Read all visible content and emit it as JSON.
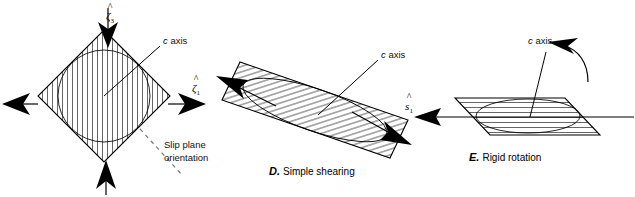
{
  "figure": {
    "background_color": "#ffffff",
    "line_color": "#000000",
    "dash_color": "#777777"
  },
  "panels": [
    {
      "id": "C",
      "name": "pure-shear-panel",
      "caption_letter": "",
      "caption_text": "",
      "crystal_shape": "rotated-square",
      "hatch_direction": "vertical",
      "labels": {
        "c_axis": "c axis",
        "c_axis_italic_part": "c",
        "c_axis_rest": " axis",
        "slip_plane_line1": "Slip plane",
        "slip_plane_line2": "orientation",
        "axis_top": "ζ",
        "axis_top_sub": "3",
        "axis_right": "ζ",
        "axis_right_sub": "1"
      },
      "arrows": [
        {
          "name": "compression-arrow-top",
          "direction": "down"
        },
        {
          "name": "compression-arrow-bottom",
          "direction": "up"
        },
        {
          "name": "extension-arrow-left",
          "direction": "left"
        },
        {
          "name": "extension-arrow-right",
          "direction": "right"
        }
      ]
    },
    {
      "id": "D",
      "name": "simple-shearing-panel",
      "caption_letter": "D.",
      "caption_text": "Simple shearing",
      "crystal_shape": "sheared-parallelogram",
      "hatch_direction": "inclined",
      "labels": {
        "c_axis": "c axis",
        "c_axis_italic_part": "c",
        "c_axis_rest": " axis"
      },
      "arrows": [
        {
          "name": "shear-arrow-upper-left",
          "direction": "up-left"
        },
        {
          "name": "shear-arrow-lower-right",
          "direction": "down-right"
        }
      ]
    },
    {
      "id": "E",
      "name": "rigid-rotation-panel",
      "caption_letter": "E.",
      "caption_text": "Rigid rotation",
      "crystal_shape": "flat-parallelogram",
      "hatch_direction": "horizontal",
      "labels": {
        "c_axis": "c axis",
        "c_axis_italic_part": "c",
        "c_axis_rest": " axis",
        "axis_left": "s",
        "axis_left_sub": "1"
      },
      "arrows": [
        {
          "name": "rotation-arrow-curved",
          "direction": "counterclockwise"
        },
        {
          "name": "shear-axis-arrow-left",
          "direction": "left"
        }
      ]
    }
  ]
}
